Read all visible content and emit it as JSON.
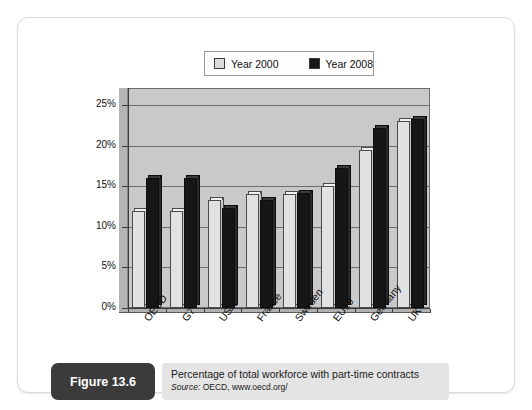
{
  "figure": {
    "badge_label": "Figure 13.6",
    "caption_title": "Percentage of total workforce with part-time contracts",
    "source_prefix": "Source:",
    "source_text": " OECD, www.oecd.org/"
  },
  "legend": {
    "items": [
      {
        "label": "Year 2000",
        "swatch": "light-swatch-icon",
        "color": "#dcdcdc"
      },
      {
        "label": "Year 2008",
        "swatch": "dark-swatch-icon",
        "color": "#161616"
      }
    ]
  },
  "colors": {
    "plot_background": "#c9c9c9",
    "series_2000": "#e2e2e2",
    "series_2008": "#161616",
    "gridline": "#6e6e6e",
    "caption_badge": "#3b3b3b",
    "caption_panel": "#e4e4e4"
  },
  "chart_data": {
    "type": "bar",
    "title": "Percentage of total workforce with part-time contracts",
    "xlabel": "",
    "ylabel": "",
    "ylim": [
      0,
      25
    ],
    "ytick_labels": [
      "0%",
      "5%",
      "10%",
      "15%",
      "20%",
      "25%"
    ],
    "ytick_values": [
      0,
      5,
      10,
      15,
      20,
      25
    ],
    "grid": true,
    "legend_position": "top-center",
    "categories": [
      "OECD",
      "G7",
      "USA",
      "France",
      "Sweden",
      "EU19",
      "Germany",
      "UK"
    ],
    "series": [
      {
        "name": "Year 2000",
        "values": [
          11.9,
          11.9,
          13.3,
          14.0,
          14.0,
          15.0,
          19.4,
          23.0
        ]
      },
      {
        "name": "Year 2008",
        "values": [
          16.0,
          16.0,
          12.3,
          13.3,
          14.2,
          17.2,
          22.2,
          23.3
        ]
      }
    ]
  }
}
